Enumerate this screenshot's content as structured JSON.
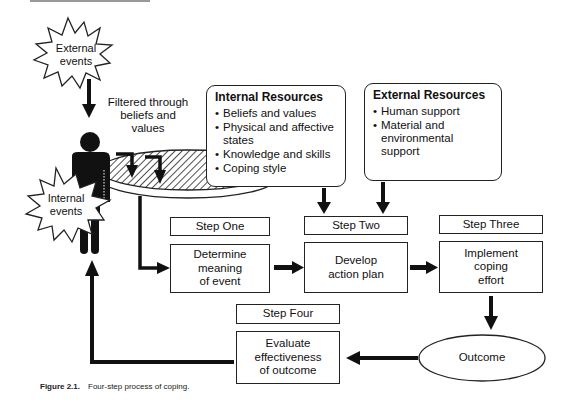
{
  "diagram": {
    "external_events": {
      "label_lines": [
        "External",
        "events"
      ]
    },
    "internal_events": {
      "label_lines": [
        "Internal",
        "events"
      ]
    },
    "filter_label": {
      "lines": [
        "Filtered through",
        "beliefs and",
        "values"
      ]
    },
    "internal_resources": {
      "title": "Internal Resources",
      "items": [
        "Beliefs and values",
        "Physical and affective states",
        "Knowledge and skills",
        "Coping style"
      ]
    },
    "external_resources": {
      "title": "External Resources",
      "items": [
        "Human support",
        "Material and environmental support"
      ]
    },
    "steps": [
      {
        "step_label": "Step One",
        "action_lines": [
          "Determine",
          "meaning",
          "of event"
        ]
      },
      {
        "step_label": "Step Two",
        "action_lines": [
          "Develop",
          "action plan"
        ]
      },
      {
        "step_label": "Step Three",
        "action_lines": [
          "Implement",
          "coping",
          "effort"
        ]
      },
      {
        "step_label": "Step Four",
        "action_lines": [
          "Evaluate",
          "effectiveness",
          "of outcome"
        ]
      }
    ],
    "outcome": {
      "label": "Outcome"
    },
    "caption": {
      "figure_number": "Figure 2.1.",
      "text": "Four-step process of coping."
    },
    "colors": {
      "ink": "#111111",
      "background": "#ffffff",
      "hatch": "#222222"
    }
  }
}
